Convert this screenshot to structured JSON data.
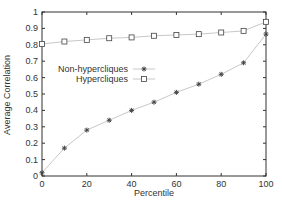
{
  "chart_data": {
    "type": "line",
    "title": "",
    "xlabel": "Percentile",
    "ylabel": "Average Correlation",
    "xlim": [
      0,
      100
    ],
    "ylim": [
      0,
      1
    ],
    "xticks": [
      0,
      20,
      40,
      60,
      80,
      100
    ],
    "yticks": [
      0,
      0.1,
      0.2,
      0.3,
      0.4,
      0.5,
      0.6,
      0.7,
      0.8,
      0.9,
      1
    ],
    "grid": false,
    "legend_position": "inside-upper-left-center",
    "x": [
      0,
      10,
      20,
      30,
      40,
      50,
      60,
      70,
      80,
      90,
      100
    ],
    "series": [
      {
        "name": "Non-hypercliques",
        "marker": "star",
        "values": [
          0.02,
          0.17,
          0.28,
          0.34,
          0.4,
          0.45,
          0.51,
          0.56,
          0.62,
          0.69,
          0.865
        ]
      },
      {
        "name": "Hypercliques",
        "marker": "square",
        "values": [
          0.805,
          0.82,
          0.83,
          0.84,
          0.845,
          0.855,
          0.86,
          0.865,
          0.875,
          0.885,
          0.94
        ]
      }
    ]
  },
  "colors": {
    "axis": "#333333",
    "line": "#c8c8c8",
    "marker": "#444444"
  }
}
